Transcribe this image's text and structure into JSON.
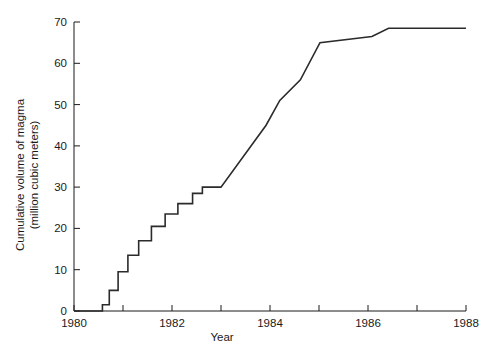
{
  "chart_data": {
    "type": "line",
    "title": "",
    "subtitle": "",
    "xlabel": "Year",
    "ylabel": "Cumulative volume of magma (million cubic meters)",
    "ylabel_line1": "Cumulative volume of magma",
    "ylabel_line2": "(million cubic meters)",
    "xlim": [
      1980,
      1988
    ],
    "ylim": [
      0,
      70
    ],
    "grid": false,
    "legend": null,
    "drawstyle": "steps-post",
    "x_ticks_major": [
      1980,
      1982,
      1984,
      1986,
      1988
    ],
    "x_tick_labels": [
      "1980",
      "1982",
      "1984",
      "1986",
      "1988"
    ],
    "x_ticks_minor": [
      1981,
      1983,
      1985,
      1987
    ],
    "y_ticks": [
      0,
      10,
      20,
      30,
      40,
      50,
      60,
      70
    ],
    "y_tick_labels": [
      "0",
      "10",
      "20",
      "30",
      "40",
      "50",
      "60",
      "70"
    ],
    "series": [
      {
        "name": "Cumulative magma volume",
        "color": "#2b2b2b",
        "x": [
          1980.0,
          1980.58,
          1980.58,
          1980.72,
          1980.72,
          1980.9,
          1980.9,
          1981.1,
          1981.1,
          1981.32,
          1981.32,
          1981.58,
          1981.58,
          1981.86,
          1981.86,
          1982.12,
          1982.12,
          1982.42,
          1982.42,
          1982.62,
          1982.62,
          1983.0,
          1983.92,
          1983.92,
          1984.2,
          1984.2,
          1984.62,
          1984.62,
          1985.02,
          1985.02,
          1986.08,
          1986.08,
          1986.42,
          1986.42,
          1988.0
        ],
        "y": [
          0.0,
          0.0,
          1.5,
          1.5,
          5.0,
          5.0,
          9.5,
          9.5,
          13.5,
          13.5,
          17.0,
          17.0,
          20.5,
          20.5,
          23.5,
          23.5,
          26.0,
          26.0,
          28.5,
          28.5,
          30.0,
          30.0,
          45.0,
          45.0,
          51.0,
          51.0,
          56.0,
          56.0,
          65.0,
          65.0,
          66.5,
          66.5,
          68.5,
          68.5,
          68.5
        ]
      }
    ],
    "annotations": []
  }
}
